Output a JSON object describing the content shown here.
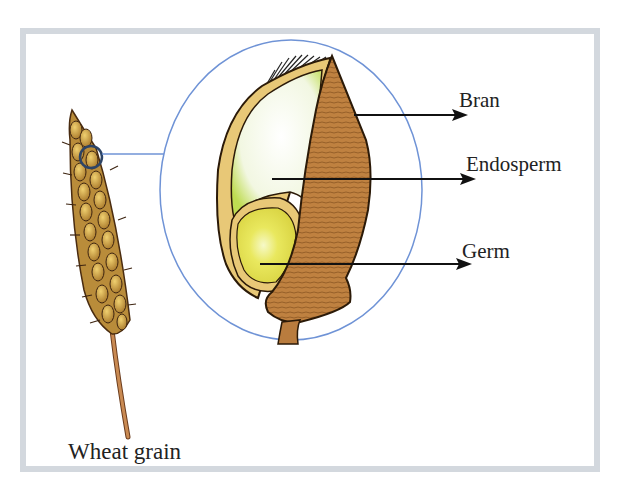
{
  "diagram": {
    "labels": {
      "bran": "Bran",
      "endosperm": "Endosperm",
      "germ": "Germ",
      "wheat_grain": "Wheat grain"
    },
    "colors": {
      "frame": "#d3d8de",
      "magnifier_circle": "#6f93d6",
      "bran": "#b97c3e",
      "bran_dark": "#8a5522",
      "endosperm": "#f3f7e4",
      "endosperm_edge": "#b9d94a",
      "germ": "#e6e35a",
      "husk": "#e8c877",
      "arrow": "#111111"
    }
  }
}
